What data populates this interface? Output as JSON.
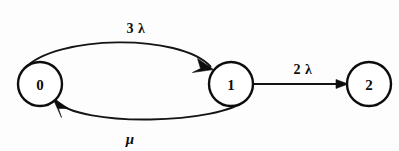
{
  "diagram": {
    "type": "state-transition-diagram",
    "background_color": "#fdfdfd",
    "stroke_color": "#0d0d0d",
    "nodes": [
      {
        "id": "0",
        "label": "0",
        "cx": 40,
        "cy": 84,
        "r": 22
      },
      {
        "id": "1",
        "label": "1",
        "cx": 231,
        "cy": 84,
        "r": 22
      },
      {
        "id": "2",
        "label": "2",
        "cx": 369,
        "cy": 84,
        "r": 22
      }
    ],
    "edges": [
      {
        "id": "edge-0-to-1",
        "from": "0",
        "to": "1",
        "label": "3 λ",
        "shape": "curve-upper",
        "label_x": 136,
        "label_y": 28
      },
      {
        "id": "edge-1-to-0",
        "from": "1",
        "to": "0",
        "label": "μ",
        "shape": "curve-lower",
        "label_x": 130,
        "label_y": 139
      },
      {
        "id": "edge-1-to-2",
        "from": "1",
        "to": "2",
        "label": "2 λ",
        "shape": "straight",
        "label_x": 303,
        "label_y": 69
      }
    ]
  }
}
